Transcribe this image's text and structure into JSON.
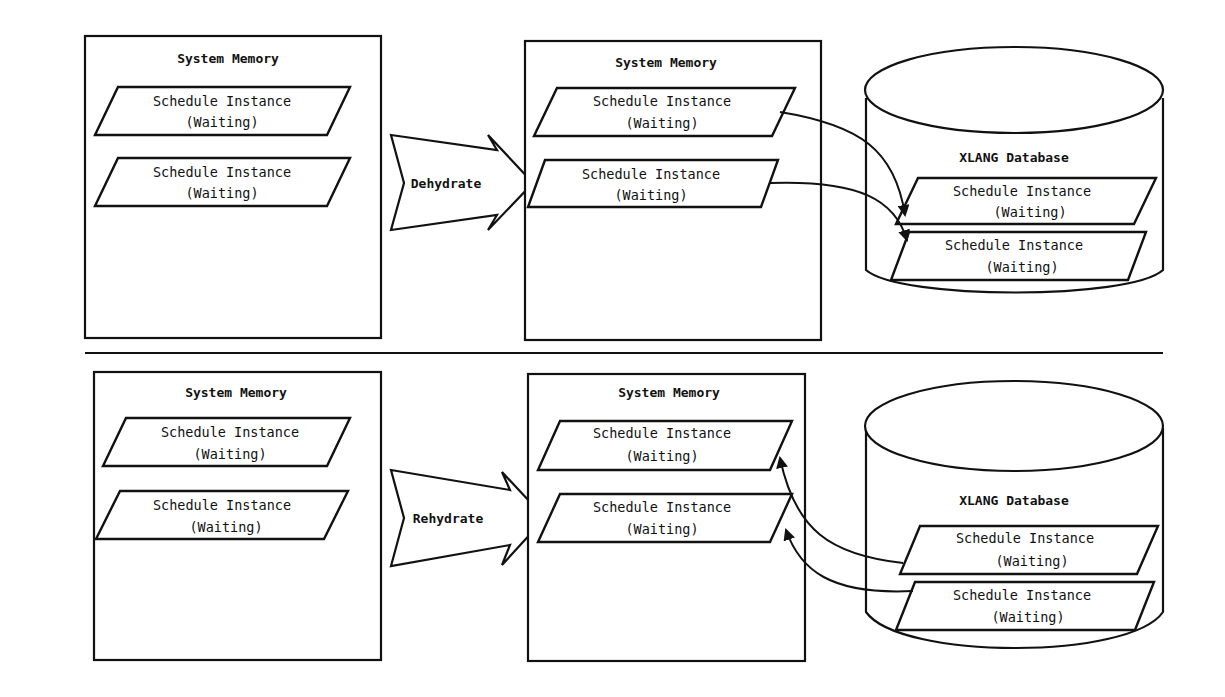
{
  "top_panel": {
    "left_memory": {
      "title": "System Memory",
      "instances": [
        {
          "line1": "Schedule Instance",
          "line2": "(Waiting)"
        },
        {
          "line1": "Schedule Instance",
          "line2": "(Waiting)"
        }
      ]
    },
    "action_arrow": {
      "label": "Dehydrate"
    },
    "right_memory": {
      "title": "System Memory",
      "instances": [
        {
          "line1": "Schedule Instance",
          "line2": "(Waiting)"
        },
        {
          "line1": "Schedule Instance",
          "line2": "(Waiting)"
        }
      ]
    },
    "database": {
      "title": "XLANG Database",
      "instances": [
        {
          "line1": "Schedule Instance",
          "line2": "(Waiting)"
        },
        {
          "line1": "Schedule Instance",
          "line2": "(Waiting)"
        }
      ]
    },
    "flow_direction": "memory-to-database"
  },
  "bottom_panel": {
    "left_memory": {
      "title": "System Memory",
      "instances": [
        {
          "line1": "Schedule Instance",
          "line2": "(Waiting)"
        },
        {
          "line1": "Schedule Instance",
          "line2": "(Waiting)"
        }
      ]
    },
    "action_arrow": {
      "label": "Rehydrate"
    },
    "right_memory": {
      "title": "System Memory",
      "instances": [
        {
          "line1": "Schedule Instance",
          "line2": "(Waiting)"
        },
        {
          "line1": "Schedule Instance",
          "line2": "(Waiting)"
        }
      ]
    },
    "database": {
      "title": "XLANG Database",
      "instances": [
        {
          "line1": "Schedule Instance",
          "line2": "(Waiting)"
        },
        {
          "line1": "Schedule Instance",
          "line2": "(Waiting)"
        }
      ]
    },
    "flow_direction": "database-to-memory"
  },
  "colors": {
    "stroke": "#111111",
    "background": "#ffffff"
  }
}
